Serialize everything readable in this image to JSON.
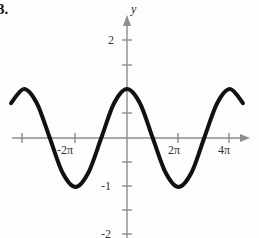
{
  "problem": {
    "number": "3."
  },
  "chart_data": {
    "type": "line",
    "title": "",
    "subtitle": "",
    "xlabel": "",
    "ylabel": "y",
    "function": "y = cos(x)",
    "amplitude": 1,
    "period": "2π",
    "xlim": [
      "-3π",
      "5π"
    ],
    "ylim": [
      -2,
      2.4
    ],
    "grid": false,
    "legend": null,
    "x_axis": {
      "label": "",
      "tick_labels": [
        "",
        "-2π",
        "2π",
        "4π"
      ],
      "tick_values": [
        "-3π",
        "-2π",
        "2π",
        "4π"
      ],
      "arrow": "right"
    },
    "y_axis": {
      "label": "y",
      "tick_labels": [
        "2",
        "",
        "",
        "-1",
        "-2"
      ],
      "tick_values": [
        2,
        1,
        -0.5,
        -1,
        -2
      ],
      "labeled_ticks": [
        {
          "value": 2,
          "text": "2"
        },
        {
          "value": -1,
          "text": "-1"
        },
        {
          "value": -2,
          "text": "-2"
        }
      ],
      "arrow": "up"
    },
    "key_points": [
      {
        "x": "-2π",
        "y": 1,
        "kind": "maximum"
      },
      {
        "x": "-π",
        "y": -1,
        "kind": "minimum"
      },
      {
        "x": "0",
        "y": 1,
        "kind": "maximum"
      },
      {
        "x": "π",
        "y": -1,
        "kind": "minimum"
      },
      {
        "x": "2π",
        "y": 1,
        "kind": "maximum"
      },
      {
        "x": "3π",
        "y": -1,
        "kind": "minimum"
      },
      {
        "x": "4π",
        "y": 1,
        "kind": "maximum"
      }
    ],
    "series": [
      {
        "name": "cos(x)",
        "color": "#111111",
        "line_width": 4,
        "x": [
          -9.42,
          -8.64,
          -7.85,
          -7.07,
          -6.28,
          -5.5,
          -4.71,
          -3.93,
          -3.14,
          -2.36,
          -1.57,
          -0.79,
          0.0,
          0.79,
          1.57,
          2.36,
          3.14,
          3.93,
          4.71,
          5.5,
          6.28,
          7.07,
          7.85,
          8.64,
          9.42,
          10.21,
          10.99,
          11.78,
          12.57,
          13.35,
          14.14
        ],
        "values": [
          -1.0,
          -0.71,
          0.0,
          0.71,
          1.0,
          0.71,
          0.0,
          -0.71,
          -1.0,
          -0.71,
          0.0,
          0.71,
          1.0,
          0.71,
          0.0,
          -0.71,
          -1.0,
          -0.71,
          0.0,
          0.71,
          1.0,
          0.71,
          0.0,
          -0.71,
          -1.0,
          -0.71,
          0.0,
          0.71,
          1.0,
          0.71,
          0.3
        ]
      }
    ],
    "colors": {
      "curve": "#111111",
      "axis": "#8d8d8d",
      "text": "#333333",
      "background": "#fdfdfd"
    }
  }
}
